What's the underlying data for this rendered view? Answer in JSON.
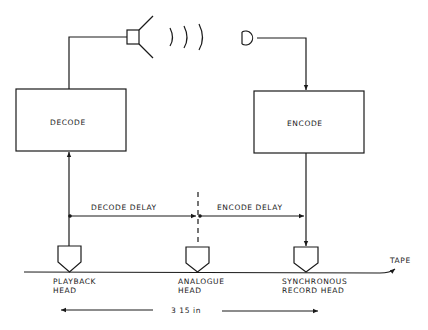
{
  "diagram": {
    "blocks": {
      "decode": {
        "label": "DECODE"
      },
      "encode": {
        "label": "ENCODE"
      }
    },
    "delays": {
      "decode_delay": "DECODE DELAY",
      "encode_delay": "ENCODE DELAY"
    },
    "heads": {
      "playback": {
        "line1": "PLAYBACK",
        "line2": "HEAD"
      },
      "analogue": {
        "line1": "ANALOGUE",
        "line2": "HEAD"
      },
      "synchronous": {
        "line1": "SYNCHRONOUS",
        "line2": "RECORD HEAD"
      }
    },
    "tape_label": "TAPE",
    "spacing_label": "3 15 in",
    "icons": {
      "output": "loudspeaker-icon",
      "sound": "sound-waves-icon",
      "input": "microphone-icon"
    },
    "colors": {
      "ink": "#1a1a1a",
      "background": "#ffffff"
    }
  }
}
